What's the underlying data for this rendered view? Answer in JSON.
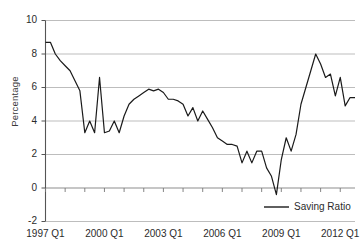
{
  "chart_data": {
    "type": "line",
    "title": "",
    "xlabel": "",
    "ylabel": "Percentage",
    "ylim": [
      -2,
      10
    ],
    "yticks": [
      -2,
      0,
      2,
      4,
      6,
      8,
      10
    ],
    "grid": true,
    "legend_position": "bottom-right",
    "x_tick_labels": [
      "1997 Q1",
      "2000 Q1",
      "2003 Q1",
      "2006 Q1",
      "2009 Q1",
      "2012 Q1"
    ],
    "x_start": "1997 Q1",
    "x_end": "2012 Q4",
    "series": [
      {
        "name": "Saving Ratio",
        "color": "#1a1a1a",
        "x": [
          "1997 Q1",
          "1997 Q2",
          "1997 Q3",
          "1997 Q4",
          "1998 Q1",
          "1998 Q2",
          "1998 Q3",
          "1998 Q4",
          "1999 Q1",
          "1999 Q2",
          "1999 Q3",
          "1999 Q4",
          "2000 Q1",
          "2000 Q2",
          "2000 Q3",
          "2000 Q4",
          "2001 Q1",
          "2001 Q2",
          "2001 Q3",
          "2001 Q4",
          "2002 Q1",
          "2002 Q2",
          "2002 Q3",
          "2002 Q4",
          "2003 Q1",
          "2003 Q2",
          "2003 Q3",
          "2003 Q4",
          "2004 Q1",
          "2004 Q2",
          "2004 Q3",
          "2004 Q4",
          "2005 Q1",
          "2005 Q2",
          "2005 Q3",
          "2005 Q4",
          "2006 Q1",
          "2006 Q2",
          "2006 Q3",
          "2006 Q4",
          "2007 Q1",
          "2007 Q2",
          "2007 Q3",
          "2007 Q4",
          "2008 Q1",
          "2008 Q2",
          "2008 Q3",
          "2008 Q4",
          "2009 Q1",
          "2009 Q2",
          "2009 Q3",
          "2009 Q4",
          "2010 Q1",
          "2010 Q2",
          "2010 Q3",
          "2010 Q4",
          "2011 Q1",
          "2011 Q2",
          "2011 Q3",
          "2011 Q4",
          "2012 Q1",
          "2012 Q2",
          "2012 Q3",
          "2012 Q4"
        ],
        "values": [
          8.7,
          8.7,
          8.0,
          7.6,
          7.3,
          7.0,
          6.4,
          5.8,
          3.3,
          4.0,
          3.3,
          6.6,
          3.3,
          3.4,
          4.0,
          3.3,
          4.3,
          5.0,
          5.3,
          5.5,
          5.7,
          5.9,
          5.8,
          5.9,
          5.7,
          5.3,
          5.3,
          5.2,
          5.0,
          4.3,
          4.8,
          4.0,
          4.6,
          4.1,
          3.6,
          3.0,
          2.8,
          2.6,
          2.6,
          2.5,
          1.5,
          2.2,
          1.5,
          2.2,
          2.2,
          1.2,
          0.7,
          -0.4,
          1.7,
          3.0,
          2.2,
          3.2,
          5.0,
          6.0,
          7.0,
          8.0,
          7.4,
          6.6,
          6.8,
          5.5,
          6.6,
          4.9,
          5.4,
          5.4
        ],
        "peak_value": 8.7,
        "min_value": -0.4,
        "end_value": 6.3
      }
    ],
    "legend": [
      {
        "label": "Saving Ratio",
        "color": "#1a1a1a"
      }
    ]
  },
  "axis": {
    "y_title": "Percentage",
    "y_tick_labels": [
      "10",
      "8",
      "6",
      "4",
      "2",
      "0",
      "-2"
    ],
    "x_tick_labels": [
      "1997 Q1",
      "2000 Q1",
      "2003 Q1",
      "2006 Q1",
      "2009 Q1",
      "2012 Q1"
    ]
  },
  "legend": {
    "entry_label": "Saving Ratio"
  },
  "colors": {
    "line": "#1a1a1a",
    "grid": "#b5b5b5",
    "axis": "#6b6b6b",
    "text": "#2b2b2b"
  }
}
